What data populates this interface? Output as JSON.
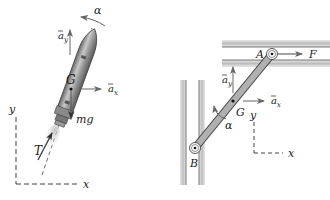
{
  "figure": {
    "left_panel": {
      "subject": "rocket",
      "labels": {
        "alpha": "α",
        "ay": "a",
        "ay_sub": "y",
        "ax": "a",
        "ax_sub": "x",
        "G": "G",
        "mg": "mg",
        "T": "T",
        "y_axis": "y",
        "x_axis": "x"
      }
    },
    "right_panel": {
      "subject": "sliding-link",
      "labels": {
        "A": "A",
        "F": "F",
        "ay": "a",
        "ay_sub": "y",
        "ax": "a",
        "ax_sub": "x",
        "G": "G",
        "alpha": "α",
        "B": "B",
        "y_axis": "y",
        "x_axis": "x"
      }
    },
    "colors": {
      "ink": "#222222",
      "arrow": "#666666",
      "body_fill": "#a8a8a8",
      "guide_fill": "#d0d0d0"
    }
  }
}
